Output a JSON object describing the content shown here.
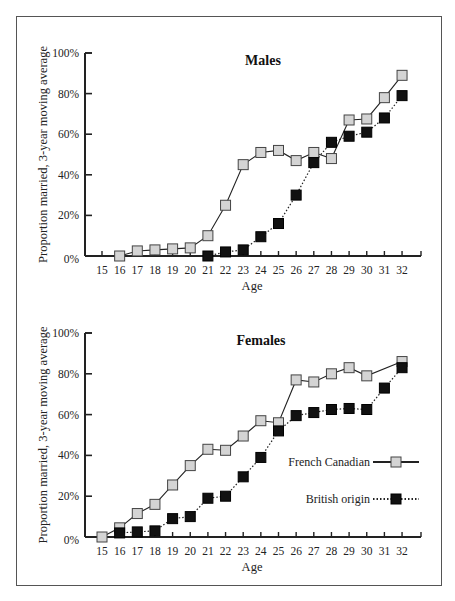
{
  "figure": {
    "ylabel": "Proportion married, 3-year moving average",
    "xlabel": "Age",
    "y_ticks": [
      "0%",
      "20%",
      "40%",
      "60%",
      "80%",
      "100%"
    ],
    "x_ticks": [
      "15",
      "16",
      "17",
      "18",
      "19",
      "20",
      "21",
      "22",
      "23",
      "24",
      "25",
      "26",
      "27",
      "28",
      "29",
      "30",
      "31",
      "32"
    ],
    "legend": [
      {
        "label": "French Canadian",
        "style": "solid",
        "marker": "light-gray-square"
      },
      {
        "label": "British origin",
        "style": "dotted",
        "marker": "black-square"
      }
    ],
    "colors": {
      "french_canadian_marker": "#d4d4d4",
      "british_marker": "#111111",
      "line": "#222222",
      "frame": "#555555"
    }
  },
  "chart_data": [
    {
      "type": "line",
      "title": "Males",
      "xlabel": "Age",
      "ylabel": "Proportion married, 3-year moving average",
      "ylim": [
        0,
        100
      ],
      "y_unit": "%",
      "grid": false,
      "legend_position": "none",
      "x": [
        15,
        16,
        17,
        18,
        19,
        20,
        21,
        22,
        23,
        24,
        25,
        26,
        27,
        28,
        29,
        30,
        31,
        32
      ],
      "series": [
        {
          "name": "French Canadian",
          "x": [
            16,
            17,
            18,
            19,
            20,
            21,
            22,
            23,
            24,
            25,
            26,
            27,
            28,
            29,
            30,
            31,
            32
          ],
          "values": [
            0,
            2.5,
            3,
            3.5,
            4,
            10,
            25,
            45,
            51,
            52,
            47,
            51,
            48,
            67,
            67.5,
            78,
            89
          ]
        },
        {
          "name": "British origin",
          "x": [
            21,
            22,
            23,
            24,
            25,
            26,
            27,
            28,
            29,
            30,
            31,
            32
          ],
          "values": [
            0,
            2,
            3,
            9.5,
            16,
            30,
            46,
            56,
            59,
            61,
            68,
            79
          ]
        }
      ]
    },
    {
      "type": "line",
      "title": "Females",
      "xlabel": "Age",
      "ylabel": "Proportion married, 3-year moving average",
      "ylim": [
        0,
        100
      ],
      "y_unit": "%",
      "grid": false,
      "legend_position": "right-middle",
      "x": [
        15,
        16,
        17,
        18,
        19,
        20,
        21,
        22,
        23,
        24,
        25,
        26,
        27,
        28,
        29,
        30,
        31,
        32
      ],
      "series": [
        {
          "name": "French Canadian",
          "x": [
            15,
            16,
            17,
            18,
            19,
            20,
            21,
            22,
            23,
            24,
            25,
            26,
            27,
            28,
            29,
            30,
            32
          ],
          "values": [
            0,
            4.5,
            11.5,
            16,
            25.5,
            35,
            43,
            42.5,
            49.5,
            57,
            56,
            77,
            76,
            80,
            83,
            79,
            86
          ]
        },
        {
          "name": "British origin",
          "x": [
            16,
            17,
            18,
            19,
            20,
            21,
            22,
            23,
            24,
            25,
            26,
            27,
            28,
            29,
            30,
            31,
            32
          ],
          "values": [
            2,
            2.5,
            3,
            9,
            10,
            19,
            20,
            29.5,
            39,
            52,
            59.5,
            61,
            62.5,
            63,
            62.5,
            73,
            83
          ]
        }
      ]
    }
  ]
}
